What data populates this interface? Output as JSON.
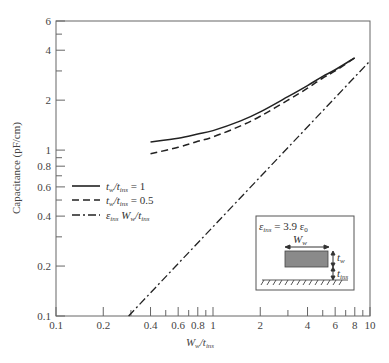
{
  "chart_data": {
    "type": "line",
    "title": "",
    "xlabel": "W_w/t_ins",
    "xlabel_parts": {
      "main": "W",
      "sub1": "w",
      "mid": "/t",
      "sub2": "ins"
    },
    "ylabel": "Capacitance (pF/cm)",
    "xscale": "log",
    "yscale": "log",
    "xlim": [
      0.1,
      10
    ],
    "ylim": [
      0.1,
      6
    ],
    "grid": false,
    "legend_position": "middle-left",
    "x_ticks": [
      {
        "value": 0.1,
        "label": "0.1"
      },
      {
        "value": 0.2,
        "label": "0.2"
      },
      {
        "value": 0.3,
        "label": ""
      },
      {
        "value": 0.4,
        "label": "0.4"
      },
      {
        "value": 0.5,
        "label": ""
      },
      {
        "value": 0.6,
        "label": "0.6"
      },
      {
        "value": 0.7,
        "label": ""
      },
      {
        "value": 0.8,
        "label": "0.8"
      },
      {
        "value": 0.9,
        "label": ""
      },
      {
        "value": 1,
        "label": "1"
      },
      {
        "value": 2,
        "label": "2"
      },
      {
        "value": 3,
        "label": ""
      },
      {
        "value": 4,
        "label": "4"
      },
      {
        "value": 5,
        "label": ""
      },
      {
        "value": 6,
        "label": "6"
      },
      {
        "value": 7,
        "label": ""
      },
      {
        "value": 8,
        "label": "8"
      },
      {
        "value": 9,
        "label": ""
      },
      {
        "value": 10,
        "label": "10"
      }
    ],
    "y_ticks": [
      {
        "value": 0.1,
        "label": "0.1"
      },
      {
        "value": 0.2,
        "label": "0.2"
      },
      {
        "value": 0.3,
        "label": ""
      },
      {
        "value": 0.4,
        "label": "0.4"
      },
      {
        "value": 0.5,
        "label": ""
      },
      {
        "value": 0.6,
        "label": "0.6"
      },
      {
        "value": 0.7,
        "label": ""
      },
      {
        "value": 0.8,
        "label": "0.8"
      },
      {
        "value": 0.9,
        "label": ""
      },
      {
        "value": 1,
        "label": "1"
      },
      {
        "value": 2,
        "label": "2"
      },
      {
        "value": 3,
        "label": ""
      },
      {
        "value": 4,
        "label": "4"
      },
      {
        "value": 5,
        "label": ""
      },
      {
        "value": 6,
        "label": "6"
      }
    ],
    "series": [
      {
        "name": "t_w/t_ins = 1",
        "legend": {
          "a": "t",
          "a_sub": "w",
          "b": "/t",
          "b_sub": "ins",
          "rest": " = 1"
        },
        "style": "solid",
        "x": [
          0.4,
          0.6,
          0.8,
          1,
          1.5,
          2,
          3,
          4,
          5,
          6,
          8
        ],
        "y": [
          1.12,
          1.18,
          1.25,
          1.31,
          1.5,
          1.7,
          2.1,
          2.45,
          2.78,
          3.05,
          3.6
        ]
      },
      {
        "name": "t_w/t_ins = 0.5",
        "legend": {
          "a": "t",
          "a_sub": "w",
          "b": "/t",
          "b_sub": "ins",
          "rest": " = 0.5"
        },
        "style": "dashed",
        "x": [
          0.4,
          0.6,
          0.8,
          1,
          1.5,
          2,
          3,
          4,
          5,
          6,
          8
        ],
        "y": [
          0.95,
          1.04,
          1.13,
          1.2,
          1.4,
          1.6,
          2.0,
          2.36,
          2.72,
          3.0,
          3.6
        ]
      },
      {
        "name": "ε_ins W_w/t_ins",
        "legend": {
          "a": "ε",
          "a_sub": "ins",
          "b": " W",
          "b_sub": "w",
          "rest": "/t",
          "rest_sub": "ins"
        },
        "style": "dashdot",
        "x": [
          0.29,
          10
        ],
        "y": [
          0.1,
          3.45
        ]
      }
    ],
    "annotations": {
      "inset": {
        "epsilon_label": {
          "a": "ε",
          "a_sub": "ins",
          "rest": " = 3.9 ε",
          "rest_sub": "0"
        },
        "width_label": {
          "a": "W",
          "a_sub": "w"
        },
        "thickness_label": {
          "a": "t",
          "a_sub": "w"
        },
        "insulator_label": {
          "a": "t",
          "a_sub": "ins"
        }
      }
    }
  },
  "colors": {
    "axis": "#666666",
    "line": "#222222",
    "wire_fill": "#8a8a8a"
  }
}
